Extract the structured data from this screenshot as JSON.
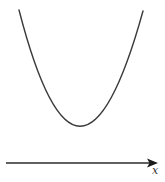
{
  "diagram": {
    "type": "function-graph",
    "axis": {
      "label": "x",
      "x_start": 6,
      "x_end": 157,
      "y": 163,
      "color": "#2b2b2b"
    },
    "curve": {
      "shape": "parabola",
      "left_top": [
        19,
        10
      ],
      "vertex": [
        79,
        126
      ],
      "right_top": [
        143,
        11
      ],
      "color": "#3a3a3a"
    }
  }
}
